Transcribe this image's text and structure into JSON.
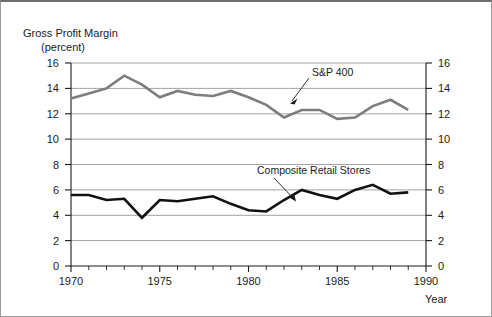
{
  "chart_data": {
    "type": "line",
    "title": "Gross Profit Margin",
    "subtitle": "(percent)",
    "xlabel": "Year",
    "ylabel": "",
    "xlim": [
      1970,
      1990
    ],
    "ylim": [
      0,
      16
    ],
    "ytick_labels": [
      "0",
      "2",
      "4",
      "6",
      "8",
      "10",
      "12",
      "14",
      "16"
    ],
    "ytick_values": [
      0,
      2,
      4,
      6,
      8,
      10,
      12,
      14,
      16
    ],
    "xtick_labels": [
      "1970",
      "1975",
      "1980",
      "1985",
      "1990"
    ],
    "xtick_values": [
      1970,
      1975,
      1980,
      1985,
      1990
    ],
    "minor_xticks": "every 1 year",
    "grid": "horizontal",
    "legend": "inline annotations with arrows",
    "dual_y_axis": true,
    "x": [
      1970,
      1971,
      1972,
      1973,
      1974,
      1975,
      1976,
      1977,
      1978,
      1979,
      1980,
      1981,
      1982,
      1983,
      1984,
      1985,
      1986,
      1987,
      1988,
      1989
    ],
    "series": [
      {
        "name": "S&P 400",
        "color": "#7d7d7d",
        "values": [
          13.2,
          13.6,
          14.0,
          15.0,
          14.3,
          13.3,
          13.8,
          13.5,
          13.4,
          13.8,
          13.3,
          12.7,
          11.7,
          12.3,
          12.3,
          11.6,
          11.7,
          12.6,
          13.1,
          12.3
        ]
      },
      {
        "name": "Composite Retail Stores",
        "color": "#111111",
        "values": [
          5.6,
          5.6,
          5.2,
          5.3,
          3.8,
          5.2,
          5.1,
          5.3,
          5.5,
          4.9,
          4.4,
          4.3,
          5.2,
          6.0,
          5.6,
          5.3,
          6.0,
          6.4,
          5.7,
          5.8
        ]
      }
    ],
    "annotations": [
      {
        "text": "S&P 400",
        "target_x": 1982,
        "target_y": 12.4
      },
      {
        "text": "Composite Retail Stores",
        "target_x": 1982.5,
        "target_y": 5.1
      }
    ]
  },
  "axes": {
    "left_ticks": [
      "16",
      "14",
      "12",
      "10",
      "8",
      "6",
      "4",
      "2",
      "0"
    ],
    "right_ticks": [
      "16",
      "14",
      "12",
      "10",
      "8",
      "6",
      "4",
      "2",
      "0"
    ],
    "bottom_ticks": [
      "1970",
      "1975",
      "1980",
      "1985",
      "1990"
    ]
  },
  "labels": {
    "title": "Gross Profit Margin",
    "subtitle": "(percent)",
    "year_axis": "Year",
    "series_sp400": "S&P 400",
    "series_retail": "Composite Retail Stores"
  }
}
